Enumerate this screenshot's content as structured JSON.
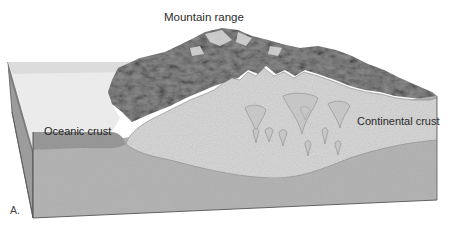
{
  "figure": {
    "panel_label": "A.",
    "labels": {
      "mountain_range": "Mountain range",
      "oceanic_crust": "Oceanic crust",
      "continental_crust": "Continental crust"
    },
    "regions": [
      {
        "name": "ocean-surface",
        "color": "#e9e9e9"
      },
      {
        "name": "mountain-range",
        "color": "#8f8f8f"
      },
      {
        "name": "oceanic-crust",
        "color": "#9a9a9a"
      },
      {
        "name": "continental-crust",
        "color": "#d6d6d6"
      },
      {
        "name": "mantle",
        "color": "#b4b4b4"
      },
      {
        "name": "side-face",
        "color": "#9c9c9c"
      }
    ],
    "pluton_count": 12
  }
}
